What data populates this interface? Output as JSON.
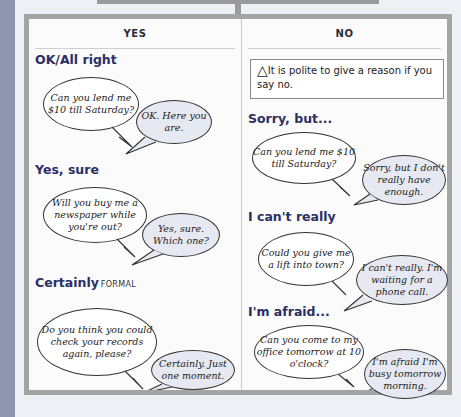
{
  "columns": {
    "yes": {
      "title": "YES",
      "sections": [
        {
          "heading": "OK/All right",
          "tag": "",
          "question": "Can you lend me $10 till Saturday?",
          "answer": "OK. Here you are."
        },
        {
          "heading": "Yes, sure",
          "tag": "",
          "question": "Will you buy me a newspaper while you're out?",
          "answer": "Yes, sure. Which one?"
        },
        {
          "heading": "Certainly",
          "tag": "FORMAL",
          "question": "Do you think you could check your records again, please?",
          "answer": "Certainly. Just one moment."
        }
      ]
    },
    "no": {
      "title": "NO",
      "note": {
        "icon": "warning-triangle-icon",
        "text": "It is polite to give a reason if you say no."
      },
      "sections": [
        {
          "heading": "Sorry, but...",
          "question": "Can you lend me $10 till Saturday?",
          "answer": "Sorry, but I don't really have enough."
        },
        {
          "heading": "I can't really",
          "question": "Could you give me a lift into town?",
          "answer": "I can't really. I'm waiting for a phone call."
        },
        {
          "heading": "I'm afraid...",
          "question": "Can you come to my office tomorrow at 10 o'clock?",
          "answer": "I'm afraid I'm busy tomorrow morning."
        }
      ]
    }
  },
  "colors": {
    "heading": "#2b2f63",
    "frame": "#a4a4a4",
    "left_band": "#8f95ac",
    "answer_bubble": "#e6e9f1"
  }
}
